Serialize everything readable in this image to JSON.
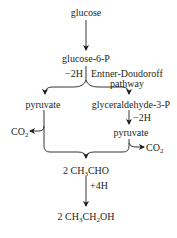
{
  "diagram": {
    "nodes": {
      "glucose": "glucose",
      "glucose6p": "glucose-6-P",
      "pyruvate_left": "pyruvate",
      "g3p": "glyceraldehyde-3-P",
      "pyruvate_right": "pyruvate",
      "acetaldehyde": {
        "coef": "2 CH",
        "sub1": "3",
        "rest": "CHO"
      },
      "ethanol": {
        "coef": "2 CH",
        "sub1": "3",
        "mid": "CH",
        "sub2": "2",
        "rest": "OH"
      }
    },
    "annotations": {
      "minus2h_top": "−2H",
      "pathway_line1": "Entner-Doudoroff",
      "pathway_line2": "pathway",
      "minus2h_right": "−2H",
      "plus4h": "+4H",
      "co2_left": {
        "base": "CO",
        "sub": "2"
      },
      "co2_right": {
        "base": "CO",
        "sub": "2"
      }
    },
    "colors": {
      "ink": "#231f20",
      "background": "#ffffff"
    }
  }
}
